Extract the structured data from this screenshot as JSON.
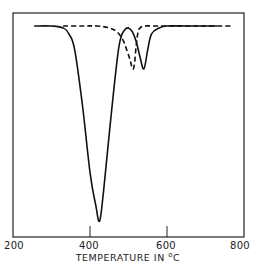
{
  "chart_data": {
    "type": "line",
    "title": "",
    "xlabel": "TEMPERATURE IN °C",
    "xlabel_parts": {
      "prefix": "TEMPERATURE IN ",
      "degree": "o",
      "unit": "C"
    },
    "ylabel": "",
    "xlim": [
      200,
      800
    ],
    "x_ticks": [
      200,
      400,
      600,
      800
    ],
    "x_tick_labels": [
      "200",
      "400",
      "600",
      "800"
    ],
    "grid": false,
    "legend": null,
    "series": [
      {
        "name": "solid curve",
        "style": "solid",
        "x": [
          255,
          300,
          330,
          345,
          360,
          380,
          400,
          415,
          425,
          435,
          450,
          470,
          480,
          490,
          500,
          510,
          520,
          530,
          540,
          550,
          560,
          580,
          600,
          650,
          700,
          730
        ],
        "y": [
          0,
          0,
          -1,
          -4,
          -12,
          -40,
          -75,
          -92,
          -100,
          -85,
          -55,
          -18,
          -6,
          -2,
          -1,
          -3,
          -8,
          -16,
          -22,
          -12,
          -4,
          -1,
          0,
          0,
          0,
          0
        ]
      },
      {
        "name": "dashed curve",
        "style": "dashed",
        "x": [
          330,
          380,
          420,
          450,
          470,
          485,
          495,
          505,
          510,
          515,
          520,
          525,
          530,
          540,
          560,
          600,
          650,
          700,
          770
        ],
        "y": [
          0,
          0,
          0,
          -1,
          -3,
          -7,
          -12,
          -18,
          -22,
          -20,
          -10,
          -3,
          -1,
          0,
          0,
          0,
          0,
          0,
          0
        ]
      }
    ]
  }
}
